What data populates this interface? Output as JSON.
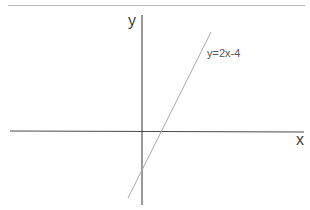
{
  "diagram": {
    "type": "coordinate-plane-line",
    "x_axis_label": "x",
    "y_axis_label": "y",
    "equation_label": "y=2x-4",
    "colors": {
      "axes": "#333333",
      "line": "#aaaaaa",
      "top_rule": "#b8b8b8",
      "text": "#444444"
    }
  }
}
